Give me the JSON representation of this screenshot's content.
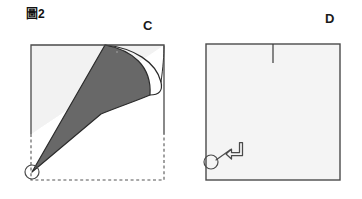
{
  "figure": {
    "caption": "圖2",
    "caption_text_plain": "Figure 2",
    "background_color": "#ffffff"
  },
  "panels": [
    {
      "id": "panel-c",
      "label": "C",
      "label_position": "top-right",
      "description": "Square sheet with a folded flap shaded dark gray; curved fold edge; dashed outline shows original square position",
      "square": {
        "left": 31,
        "top": 45,
        "right": 164,
        "bottom": 134,
        "fill_color": "#f2f2f2",
        "stroke_color": "#4a4a4a"
      },
      "dashed_outline": {
        "style": "dashed",
        "color": "#555555",
        "bottom_y": 180,
        "right_x": 164,
        "left_x": 31
      },
      "fold_shape": {
        "fill_color": "#686868",
        "stroke_color": "#2b2b2b",
        "apex_point": [
          105,
          45
        ],
        "tip_point": [
          32,
          172
        ],
        "curve_meet_point": [
          150,
          95
        ]
      },
      "marker_circle": {
        "center": [
          32,
          172
        ],
        "radius": 7,
        "stroke_color": "#4a4a4a",
        "fill": "none",
        "name": "corner-marker"
      }
    },
    {
      "id": "panel-d",
      "label": "D",
      "label_position": "top-right",
      "description": "Resulting plain square with a short tick mark on the top edge and a rotation arrow pointing from the marked corner",
      "square": {
        "left": 206,
        "top": 44,
        "right": 340,
        "bottom": 180,
        "fill_color": "#f4f4f4",
        "stroke_color": "#4a4a4a"
      },
      "tick_mark": {
        "x": 273,
        "y_start": 44,
        "y_end": 63,
        "color": "#3a3a3a"
      },
      "marker_circle": {
        "center": [
          211,
          162
        ],
        "radius": 7,
        "stroke_color": "#4a4a4a",
        "fill": "none",
        "name": "corner-marker"
      },
      "pointer_line": {
        "from": [
          216,
          160
        ],
        "to": [
          228,
          152
        ],
        "color": "#4a4a4a"
      },
      "rotate_arrow": {
        "icon": "arrow-turn-up-left-icon",
        "color": "#4a4a4a",
        "position": [
          231,
          144
        ]
      }
    }
  ],
  "colors": {
    "page_background": "#ffffff",
    "paper_light": "#f2f2f2",
    "paper_shaded": "#686868",
    "outline": "#4a4a4a",
    "fold_outline": "#2b2b2b",
    "dashed": "#555555",
    "text": "#1a1a1a"
  }
}
